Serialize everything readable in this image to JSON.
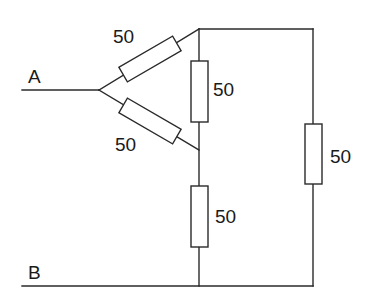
{
  "diagram": {
    "type": "circuit",
    "terminals": [
      {
        "id": "A",
        "label": "A"
      },
      {
        "id": "B",
        "label": "B"
      }
    ],
    "resistors": [
      {
        "id": "R1",
        "label": "50",
        "position": "upper-diagonal",
        "between": [
          "A-junction",
          "top-node"
        ]
      },
      {
        "id": "R2",
        "label": "50",
        "position": "lower-diagonal",
        "between": [
          "A-junction",
          "middle-node"
        ]
      },
      {
        "id": "R3",
        "label": "50",
        "position": "center-vertical-upper",
        "between": [
          "top-node",
          "middle-node"
        ]
      },
      {
        "id": "R4",
        "label": "50",
        "position": "center-vertical-lower",
        "between": [
          "middle-node",
          "B"
        ]
      },
      {
        "id": "R5",
        "label": "50",
        "position": "right-vertical",
        "between": [
          "top-node",
          "B"
        ]
      }
    ],
    "colors": {
      "line": "#2a2a2a",
      "background": "#ffffff",
      "text": "#1a1a1a"
    }
  }
}
